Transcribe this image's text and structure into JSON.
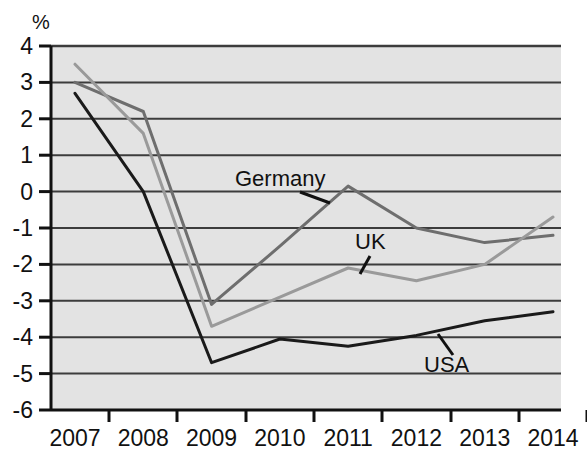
{
  "chart_data": {
    "type": "line",
    "title": "",
    "subtitle": "",
    "xlabel": "",
    "ylabel": "",
    "unit_label": "%",
    "categories": [
      "2007",
      "2008",
      "2009",
      "2010",
      "2011",
      "2012",
      "2013",
      "2014"
    ],
    "x": [
      2007,
      2008,
      2009,
      2010,
      2011,
      2012,
      2013,
      2014
    ],
    "xlim": [
      2007,
      2014
    ],
    "ylim": [
      -6,
      4
    ],
    "y_ticks": [
      "4",
      "3",
      "2",
      "1",
      "0",
      "-1",
      "-2",
      "-3",
      "-4",
      "-5",
      "-6"
    ],
    "y_tick_values": [
      4,
      3,
      2,
      1,
      0,
      -1,
      -2,
      -3,
      -4,
      -5,
      -6
    ],
    "grid": true,
    "grid_axis": "y",
    "legend_position": "inline-annotations",
    "series": [
      {
        "name": "Germany",
        "color": "#6e6e6e",
        "values": [
          3.0,
          2.2,
          -3.1,
          -1.5,
          0.15,
          -1.0,
          -1.4,
          -1.2
        ]
      },
      {
        "name": "UK",
        "color": "#9a9a9a",
        "values": [
          3.5,
          1.6,
          -3.7,
          -2.9,
          -2.1,
          -2.45,
          -2.0,
          -0.7
        ]
      },
      {
        "name": "USA",
        "color": "#1a1a1a",
        "values": [
          2.7,
          0.0,
          -4.7,
          -4.05,
          -4.25,
          -3.95,
          -3.55,
          -3.3
        ]
      }
    ],
    "annotations": [
      {
        "name": "Germany",
        "label": "Germany",
        "text_x": 235,
        "text_y": 186,
        "leader": [
          [
            300,
            192
          ],
          [
            330,
            203
          ]
        ]
      },
      {
        "name": "UK",
        "label": "UK",
        "text_x": 355,
        "text_y": 249,
        "leader": [
          [
            370,
            256
          ],
          [
            360,
            274
          ]
        ]
      },
      {
        "name": "USA",
        "label": "USA",
        "text_x": 424,
        "text_y": 372,
        "leader": [
          [
            453,
            355
          ],
          [
            438,
            334
          ]
        ]
      }
    ]
  },
  "colors": {
    "plot_background": "#e3e3e3",
    "gridline": "#3c3c3c",
    "axis": "#111111",
    "page_background": "#ffffff",
    "germany": "#6e6e6e",
    "uk": "#9a9a9a",
    "usa": "#1a1a1a"
  }
}
